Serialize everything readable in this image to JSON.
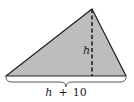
{
  "diagram": {
    "type": "triangle-area",
    "fill_color": "#bdbdbd",
    "stroke_color": "#222222",
    "vertices": {
      "left": [
        6,
        76
      ],
      "apex": [
        92,
        9
      ],
      "right": [
        126,
        76
      ]
    },
    "altitude": {
      "label": "h",
      "style": "dashed",
      "from": [
        92,
        9
      ],
      "to": [
        92,
        76
      ]
    },
    "base": {
      "label_var": "h",
      "label_op": "+",
      "label_num": "10",
      "label_full": "h + 10"
    }
  }
}
